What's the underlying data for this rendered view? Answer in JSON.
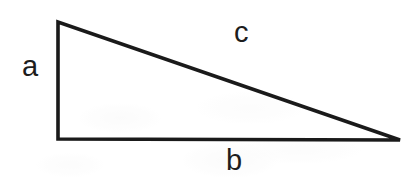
{
  "diagram": {
    "name": "right-triangle",
    "background_color": "#ffffff",
    "stroke_color": "#1a1a1a",
    "stroke_width": 3.6,
    "canvas": {
      "width": 415,
      "height": 181
    },
    "vertices": {
      "top_left": {
        "x": 58,
        "y": 22
      },
      "bottom_left": {
        "x": 58,
        "y": 139
      },
      "bottom_right": {
        "x": 400,
        "y": 140
      }
    },
    "polygon_points": "58,22 58,139 400,140",
    "labels": {
      "leg_vertical": "a",
      "hypotenuse": "c",
      "leg_horizontal": "b"
    }
  }
}
